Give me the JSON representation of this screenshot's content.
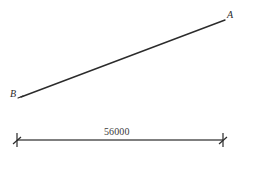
{
  "figure": {
    "type": "line-diagram",
    "background_color": "#ffffff",
    "stroke_color": "#2b2b2b",
    "dimension_stroke_color": "#555555"
  },
  "points": [
    {
      "id": "A",
      "label": "A",
      "x": 225,
      "y": 20,
      "label_x": 227,
      "label_y": 10
    },
    {
      "id": "B",
      "label": "B",
      "x": 21,
      "y": 97,
      "label_x": 10,
      "label_y": 89
    }
  ],
  "segments": [
    {
      "name": "segment-ab",
      "from": "B",
      "to": "A",
      "x1": 21,
      "y1": 97,
      "x2": 225,
      "y2": 20
    }
  ],
  "dimension": {
    "label": "56000",
    "value": 56000,
    "x1": 17,
    "x2": 223,
    "y": 140,
    "tick_style": "architectural-slash",
    "tick_half_height": 7,
    "label_position": "above-center"
  }
}
